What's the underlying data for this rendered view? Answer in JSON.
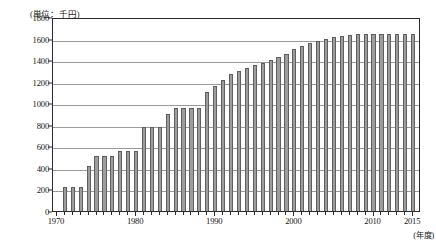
{
  "chart_data": {
    "type": "bar",
    "title": "",
    "subtitle": "",
    "unit_label": "(単位：千円)",
    "xlabel": "(年度)",
    "ylabel": "",
    "ylim": [
      0,
      1800
    ],
    "xlim": [
      1969.5,
      2016.0
    ],
    "y_ticks": [
      0,
      200,
      400,
      600,
      800,
      1000,
      1200,
      1400,
      1600,
      1800
    ],
    "y_tick_labels": [
      "0",
      "200",
      "400",
      "600",
      "800",
      "1000",
      "1200",
      "1400",
      "1600",
      "1800"
    ],
    "x_ticks": [
      1970,
      1980,
      1990,
      2000,
      2010,
      2015
    ],
    "x_tick_labels": [
      "1970",
      "1980",
      "1990",
      "2000",
      "2010",
      "2015"
    ],
    "grid": true,
    "legend": null,
    "bar_color": "#9d9d9d",
    "bar_edge_color": "#5e5e5e",
    "axis_color": "#2b2b2b",
    "grid_color": "#9a9a9a",
    "categories": [
      "1971",
      "1972",
      "1973",
      "1974",
      "1975",
      "1976",
      "1977",
      "1978",
      "1979",
      "1980",
      "1981",
      "1982",
      "1983",
      "1984",
      "1985",
      "1986",
      "1987",
      "1988",
      "1989",
      "1990",
      "1991",
      "1992",
      "1993",
      "1994",
      "1995",
      "1996",
      "1997",
      "1998",
      "1999",
      "2000",
      "2001",
      "2002",
      "2003",
      "2004",
      "2005",
      "2006",
      "2007",
      "2008",
      "2009",
      "2010",
      "2011",
      "2012",
      "2013",
      "2014",
      "2015"
    ],
    "values": [
      220,
      220,
      220,
      420,
      510,
      510,
      510,
      555,
      555,
      555,
      780,
      780,
      780,
      900,
      960,
      960,
      960,
      960,
      1100,
      1160,
      1215,
      1270,
      1300,
      1330,
      1355,
      1375,
      1400,
      1430,
      1455,
      1500,
      1530,
      1555,
      1575,
      1600,
      1610,
      1625,
      1635,
      1640,
      1640,
      1640,
      1640,
      1640,
      1640,
      1640,
      1640
    ]
  }
}
